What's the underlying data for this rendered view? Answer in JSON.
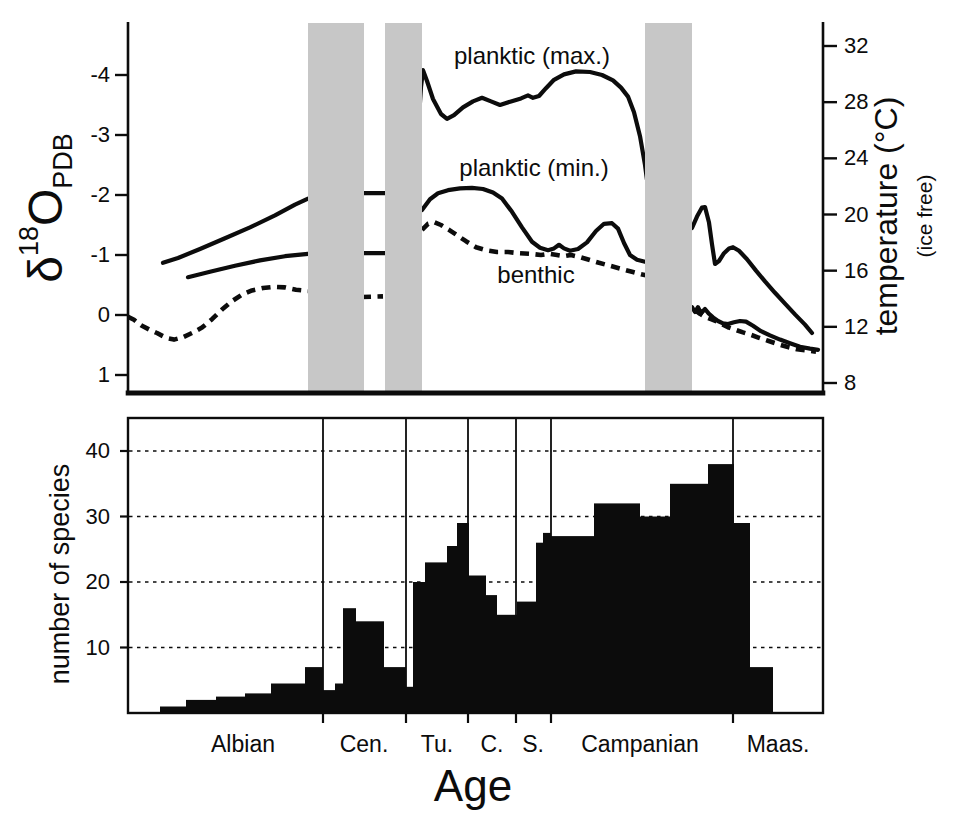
{
  "figure": {
    "bg": "#ffffff",
    "ink": "#0c0c0c",
    "band_color": "#c7c7c7"
  },
  "labels": {
    "top_y_symbol": "δ",
    "top_y_sup": "18",
    "top_y_main": "O",
    "top_y_sub": "PDB",
    "right_axis_title": "temperature (°C)",
    "right_axis_note": "(ice free)",
    "bottom_y_title": "number of species",
    "x_title": "Age"
  },
  "chart_data": [
    {
      "type": "line",
      "title": "",
      "ylabel": "δ18O PDB",
      "ylabel_right": "temperature (°C) (ice free)",
      "y_axis_inverted": true,
      "ylim": [
        1.3,
        -4.9
      ],
      "y_ticks_left": [
        "-4",
        "-3",
        "-2",
        "-1",
        "0",
        "1"
      ],
      "y_ticks_left_values": [
        -4,
        -3,
        -2,
        -1,
        0,
        1
      ],
      "y_ticks_right_temperature": [
        32,
        28,
        24,
        20,
        16,
        12,
        8
      ],
      "x_unit": "figure px (128 = left axis, 823 = right axis), no numeric x scale (geologic Age)",
      "shaded_bands_x": [
        [
          308,
          364
        ],
        [
          385,
          422
        ],
        [
          645,
          692
        ]
      ],
      "grid": false,
      "legend_position": "labels on plot",
      "series": [
        {
          "name": "planktic (max.)",
          "style": "solid",
          "segments": [
            [
              [
                163,
                -0.87
              ],
              [
                178,
                -0.95
              ],
              [
                200,
                -1.1
              ],
              [
                225,
                -1.28
              ],
              [
                250,
                -1.46
              ],
              [
                275,
                -1.66
              ],
              [
                295,
                -1.84
              ],
              [
                308,
                -1.94
              ]
            ],
            [
              [
                360,
                -2.03
              ],
              [
                388,
                -2.03
              ]
            ],
            [
              [
                419,
                -3.3
              ],
              [
                421,
                -3.8
              ],
              [
                423,
                -4.08
              ],
              [
                427,
                -3.9
              ],
              [
                433,
                -3.6
              ],
              [
                441,
                -3.35
              ],
              [
                447,
                -3.27
              ],
              [
                454,
                -3.33
              ],
              [
                463,
                -3.46
              ],
              [
                473,
                -3.56
              ],
              [
                482,
                -3.62
              ],
              [
                491,
                -3.56
              ],
              [
                500,
                -3.5
              ],
              [
                511,
                -3.56
              ],
              [
                521,
                -3.61
              ],
              [
                528,
                -3.66
              ],
              [
                533,
                -3.62
              ],
              [
                539,
                -3.65
              ],
              [
                546,
                -3.78
              ],
              [
                554,
                -3.92
              ],
              [
                564,
                -4.01
              ],
              [
                576,
                -4.06
              ],
              [
                590,
                -4.05
              ],
              [
                602,
                -4.0
              ],
              [
                613,
                -3.91
              ],
              [
                621,
                -3.79
              ],
              [
                628,
                -3.64
              ],
              [
                634,
                -3.38
              ],
              [
                640,
                -2.98
              ],
              [
                645,
                -2.5
              ],
              [
                647,
                -2.25
              ]
            ],
            [
              [
                692,
                -1.45
              ],
              [
                697,
                -1.64
              ],
              [
                702,
                -1.79
              ],
              [
                705,
                -1.8
              ],
              [
                709,
                -1.54
              ],
              [
                712,
                -1.18
              ],
              [
                715,
                -0.85
              ],
              [
                719,
                -0.9
              ],
              [
                724,
                -1.03
              ],
              [
                729,
                -1.11
              ],
              [
                733,
                -1.13
              ],
              [
                739,
                -1.07
              ],
              [
                747,
                -0.93
              ],
              [
                756,
                -0.74
              ],
              [
                765,
                -0.56
              ],
              [
                775,
                -0.37
              ],
              [
                785,
                -0.19
              ],
              [
                795,
                -0.01
              ],
              [
                805,
                0.16
              ],
              [
                812,
                0.3
              ]
            ]
          ]
        },
        {
          "name": "planktic (min.)",
          "style": "solid",
          "segments": [
            [
              [
                188,
                -0.63
              ],
              [
                210,
                -0.72
              ],
              [
                235,
                -0.82
              ],
              [
                260,
                -0.91
              ],
              [
                285,
                -0.98
              ],
              [
                308,
                -1.02
              ]
            ],
            [
              [
                360,
                -1.03
              ],
              [
                388,
                -1.03
              ]
            ],
            [
              [
                422,
                -1.75
              ],
              [
                430,
                -1.93
              ],
              [
                438,
                -2.03
              ],
              [
                448,
                -2.08
              ],
              [
                460,
                -2.11
              ],
              [
                472,
                -2.12
              ],
              [
                483,
                -2.1
              ],
              [
                493,
                -2.04
              ],
              [
                502,
                -1.94
              ],
              [
                512,
                -1.72
              ],
              [
                522,
                -1.46
              ],
              [
                532,
                -1.22
              ],
              [
                540,
                -1.12
              ],
              [
                548,
                -1.08
              ],
              [
                554,
                -1.11
              ],
              [
                559,
                -1.17
              ],
              [
                564,
                -1.11
              ],
              [
                570,
                -1.07
              ],
              [
                578,
                -1.1
              ],
              [
                587,
                -1.21
              ],
              [
                596,
                -1.4
              ],
              [
                604,
                -1.52
              ],
              [
                612,
                -1.53
              ],
              [
                618,
                -1.44
              ],
              [
                624,
                -1.2
              ],
              [
                630,
                -1.0
              ],
              [
                637,
                -0.92
              ],
              [
                647,
                -0.88
              ]
            ],
            [
              [
                692,
                -0.13
              ],
              [
                695,
                -0.05
              ],
              [
                698,
                -0.13
              ],
              [
                701,
                -0.03
              ],
              [
                705,
                -0.1
              ],
              [
                709,
                -0.02
              ],
              [
                713,
                0.04
              ],
              [
                718,
                0.1
              ],
              [
                723,
                0.14
              ],
              [
                728,
                0.15
              ],
              [
                734,
                0.12
              ],
              [
                740,
                0.1
              ],
              [
                746,
                0.11
              ],
              [
                753,
                0.18
              ],
              [
                761,
                0.27
              ],
              [
                770,
                0.34
              ],
              [
                780,
                0.41
              ],
              [
                790,
                0.47
              ],
              [
                800,
                0.53
              ],
              [
                810,
                0.56
              ],
              [
                818,
                0.58
              ]
            ]
          ]
        },
        {
          "name": "benthic",
          "style": "dashed",
          "segments": [
            [
              [
                128,
                0.03
              ],
              [
                134,
                0.08
              ],
              [
                141,
                0.17
              ],
              [
                149,
                0.24
              ],
              [
                157,
                0.3
              ],
              [
                166,
                0.38
              ],
              [
                174,
                0.41
              ],
              [
                183,
                0.37
              ],
              [
                192,
                0.3
              ],
              [
                202,
                0.21
              ],
              [
                212,
                0.07
              ],
              [
                222,
                -0.09
              ],
              [
                232,
                -0.23
              ],
              [
                242,
                -0.34
              ],
              [
                252,
                -0.41
              ],
              [
                263,
                -0.45
              ],
              [
                274,
                -0.47
              ],
              [
                285,
                -0.46
              ],
              [
                296,
                -0.42
              ],
              [
                308,
                -0.4
              ]
            ],
            [
              [
                362,
                -0.3
              ],
              [
                383,
                -0.31
              ]
            ],
            [
              [
                422,
                -1.42
              ],
              [
                428,
                -1.52
              ],
              [
                434,
                -1.55
              ],
              [
                441,
                -1.5
              ],
              [
                449,
                -1.42
              ],
              [
                457,
                -1.33
              ],
              [
                466,
                -1.23
              ],
              [
                476,
                -1.13
              ],
              [
                486,
                -1.08
              ],
              [
                497,
                -1.05
              ],
              [
                508,
                -1.05
              ],
              [
                519,
                -1.03
              ],
              [
                530,
                -1.02
              ],
              [
                541,
                -1.0
              ],
              [
                549,
                -1.02
              ],
              [
                557,
                -1.0
              ],
              [
                564,
                -0.98
              ],
              [
                571,
                -1.0
              ],
              [
                579,
                -0.97
              ],
              [
                589,
                -0.92
              ],
              [
                599,
                -0.87
              ],
              [
                610,
                -0.82
              ],
              [
                621,
                -0.77
              ],
              [
                632,
                -0.72
              ],
              [
                641,
                -0.68
              ],
              [
                647,
                -0.66
              ]
            ],
            [
              [
                695,
                -0.08
              ],
              [
                700,
                -0.02
              ],
              [
                705,
                0.03
              ],
              [
                711,
                0.07
              ],
              [
                717,
                0.11
              ],
              [
                723,
                0.16
              ],
              [
                729,
                0.21
              ],
              [
                736,
                0.25
              ],
              [
                743,
                0.29
              ],
              [
                751,
                0.33
              ],
              [
                759,
                0.38
              ],
              [
                768,
                0.43
              ],
              [
                777,
                0.48
              ],
              [
                787,
                0.53
              ],
              [
                797,
                0.57
              ],
              [
                807,
                0.59
              ],
              [
                816,
                0.61
              ]
            ]
          ]
        }
      ]
    },
    {
      "type": "bar",
      "title": "",
      "ylabel": "number of species",
      "xlabel": "Age",
      "ylim": [
        0,
        45
      ],
      "y_ticks": [
        10,
        20,
        30,
        40
      ],
      "grid": "horizontal dashed at y ticks",
      "x_unit": "figure px (128 = left axis, 823 = right axis), geologic Age",
      "stage_boundaries_x": [
        323,
        406,
        468,
        516,
        551,
        733
      ],
      "stages": [
        {
          "label": "Albian",
          "center_x": 243
        },
        {
          "label": "Cen.",
          "center_x": 364
        },
        {
          "label": "Tu.",
          "center_x": 437
        },
        {
          "label": "C.",
          "center_x": 492
        },
        {
          "label": "S.",
          "center_x": 533
        },
        {
          "label": "Campanian",
          "center_x": 640
        },
        {
          "label": "Maas.",
          "center_x": 778
        }
      ],
      "bars_x0_x1_count": [
        [
          160,
          186,
          1
        ],
        [
          186,
          216,
          2
        ],
        [
          216,
          245,
          2.5
        ],
        [
          245,
          271,
          3
        ],
        [
          271,
          305,
          4.5
        ],
        [
          305,
          323,
          7
        ],
        [
          323,
          335,
          3.5
        ],
        [
          335,
          343,
          4.5
        ],
        [
          343,
          356,
          16
        ],
        [
          356,
          384,
          14
        ],
        [
          384,
          406,
          7
        ],
        [
          406,
          413,
          4
        ],
        [
          413,
          425,
          20
        ],
        [
          425,
          447,
          23
        ],
        [
          447,
          457,
          25.5
        ],
        [
          457,
          469,
          29
        ],
        [
          469,
          486,
          21
        ],
        [
          486,
          497,
          18
        ],
        [
          497,
          517,
          15
        ],
        [
          517,
          536,
          17
        ],
        [
          536,
          543,
          26
        ],
        [
          543,
          551,
          27.5
        ],
        [
          551,
          594,
          27
        ],
        [
          594,
          640,
          32
        ],
        [
          640,
          670,
          30
        ],
        [
          670,
          708,
          35
        ],
        [
          708,
          734,
          38
        ],
        [
          734,
          750,
          29
        ],
        [
          750,
          773,
          7
        ]
      ]
    }
  ]
}
